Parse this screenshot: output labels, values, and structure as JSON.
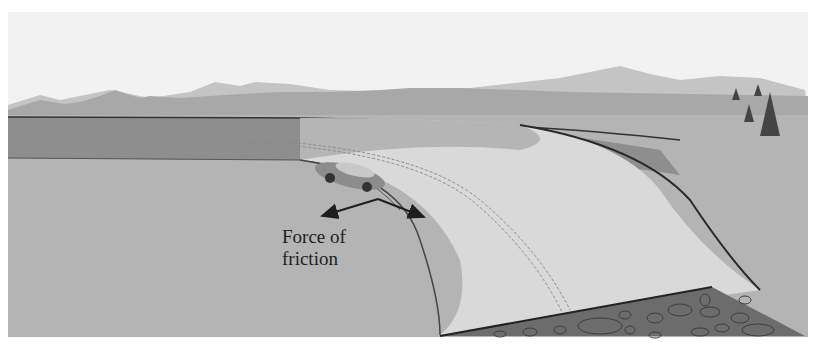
{
  "figure": {
    "type": "illustration",
    "label": {
      "line1": "Force of",
      "line2": "friction"
    },
    "arrows": [
      {
        "name": "friction-arrow-left",
        "direction": "toward center of curve"
      },
      {
        "name": "friction-arrow-right",
        "direction": "forward-right"
      }
    ],
    "elements": [
      "sky",
      "mountains",
      "grass-field",
      "road",
      "car",
      "trees",
      "rocky-embankment"
    ],
    "colors": {
      "sky": "#f2f2f2",
      "mountain_far": "#c2c2c2",
      "mountain_near": "#a9a9a9",
      "field": "#b3b3b3",
      "road_dark": "#8f8f8f",
      "road_light": "#dcdcdc",
      "rock": "#6e6e6e",
      "arrow": "#1e1e1e"
    }
  }
}
